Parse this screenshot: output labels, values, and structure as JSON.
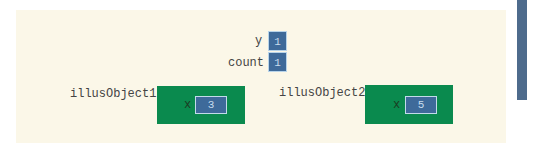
{
  "variables": [
    {
      "name": "y",
      "value": "1"
    },
    {
      "name": "count",
      "value": "1"
    }
  ],
  "objects": [
    {
      "name": "illusObject1",
      "field": "x",
      "value": "3"
    },
    {
      "name": "illusObject2",
      "field": "x",
      "value": "5"
    }
  ],
  "colors": {
    "panel": "#fbf7e8",
    "object_box": "#0a8a4e",
    "value_box": "#3e6a9a",
    "sidebar": "#4e6b8c"
  }
}
